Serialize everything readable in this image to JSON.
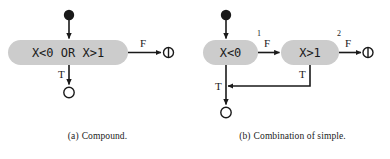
{
  "figure": {
    "type": "activity-diagram-pair",
    "background_color": "#ffffff",
    "node_fill_color": "#cccccc",
    "stroke_color": "#1a1a1a"
  },
  "panel_a": {
    "caption_tag": "(a)",
    "caption_text": "Compound.",
    "decision": {
      "label": "X<0 OR X>1"
    },
    "edges": {
      "false_label": "F",
      "true_label": "T"
    },
    "nodes": {
      "start": "initial-node",
      "true_end": "final-node-open",
      "false_end": "flow-final-node"
    }
  },
  "panel_b": {
    "caption_tag": "(b)",
    "caption_text": "Combination of simple.",
    "decision_1": {
      "label": "X<0",
      "index": "1"
    },
    "decision_2": {
      "label": "X>1",
      "index": "2"
    },
    "edges": {
      "d1_false_label": "F",
      "d1_true_label": "T",
      "d2_false_label": "F",
      "d2_true_label": "T"
    },
    "nodes": {
      "start": "initial-node",
      "true_end": "final-node-open",
      "false_end": "flow-final-node"
    }
  }
}
